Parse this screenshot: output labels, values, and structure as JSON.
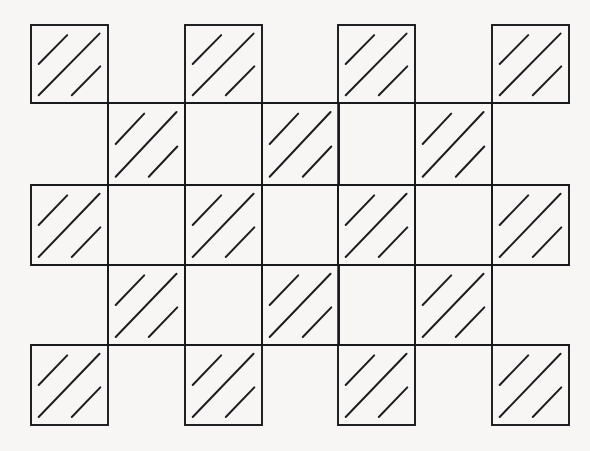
{
  "figure": {
    "title": "Hatched checkerboard weave pattern",
    "canvas": {
      "width": 590,
      "height": 451
    },
    "colors": {
      "background": "#f7f6f4",
      "ink": "#15171a",
      "hatch": "#1b1d20"
    },
    "geometry": {
      "cell_size": 77,
      "grid_origin_x": 31,
      "grid_origin_y": 25,
      "outline_stroke_width": 1.9,
      "grid_stroke_width": 1.5,
      "hatch_stroke_width": 2.0
    },
    "grid": {
      "vertical_lines_x": [
        108,
        185,
        262,
        338,
        415,
        492
      ],
      "vertical_span_y": [
        103,
        345
      ],
      "horizontal_lines_y": [
        103,
        185,
        265,
        345
      ],
      "horizontal_span_x": [
        31,
        570
      ]
    },
    "bands": [
      {
        "name": "band-top",
        "row_index": 0,
        "y_top": 25,
        "y_bottom": 103,
        "phase": "on-column",
        "cells_x": [
          31,
          185,
          338,
          492
        ]
      },
      {
        "name": "band-second",
        "row_index": 1,
        "y_top": 103,
        "y_bottom": 185,
        "phase": "off-column",
        "cells_x": [
          108,
          262,
          415
        ]
      },
      {
        "name": "band-third",
        "row_index": 2,
        "y_top": 185,
        "y_bottom": 265,
        "phase": "on-column",
        "cells_x": [
          31,
          185,
          338,
          492
        ]
      },
      {
        "name": "band-fourth",
        "row_index": 3,
        "y_top": 265,
        "y_bottom": 345,
        "phase": "off-column",
        "cells_x": [
          108,
          262,
          415
        ]
      },
      {
        "name": "band-bottom",
        "row_index": 4,
        "y_top": 345,
        "y_bottom": 425,
        "phase": "on-column",
        "cells_x": [
          31,
          185,
          338,
          492
        ]
      }
    ],
    "hatch": {
      "line_count": 3,
      "angle_degrees": 45,
      "direction": "lower-left to upper-right",
      "segments": [
        {
          "name": "short-upper-left",
          "x1": 0.1,
          "y1": 0.5,
          "x2": 0.47,
          "y2": 0.13
        },
        {
          "name": "long-diagonal",
          "x1": 0.1,
          "y1": 0.9,
          "x2": 0.89,
          "y2": 0.11
        },
        {
          "name": "short-lower-right",
          "x1": 0.53,
          "y1": 0.9,
          "x2": 0.9,
          "y2": 0.53
        }
      ]
    }
  }
}
